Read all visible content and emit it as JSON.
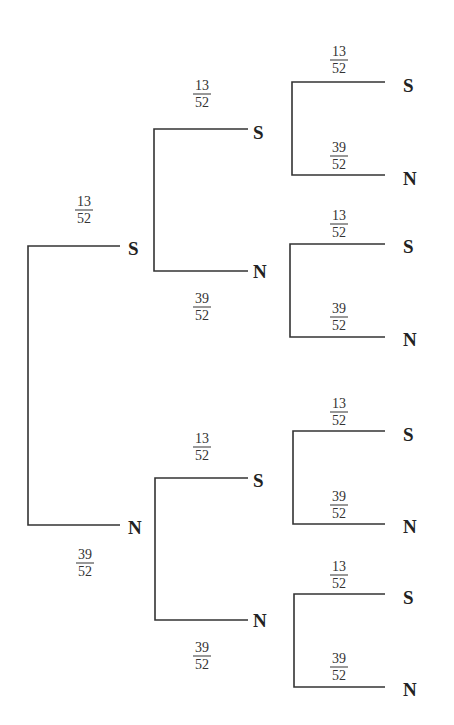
{
  "diagram": {
    "type": "probability-tree",
    "outcomes": {
      "S": "S",
      "N": "N"
    },
    "probabilities": {
      "S": {
        "num": "13",
        "den": "52"
      },
      "N": {
        "num": "39",
        "den": "52"
      }
    },
    "nodes": [
      {
        "id": "l1-S",
        "label": "S",
        "x": 128,
        "y": 248
      },
      {
        "id": "l1-N",
        "label": "N",
        "x": 128,
        "y": 527
      },
      {
        "id": "l2-SS",
        "label": "S",
        "x": 253,
        "y": 132
      },
      {
        "id": "l2-SN",
        "label": "N",
        "x": 253,
        "y": 271
      },
      {
        "id": "l2-NS",
        "label": "S",
        "x": 253,
        "y": 480
      },
      {
        "id": "l2-NN",
        "label": "N",
        "x": 253,
        "y": 620
      },
      {
        "id": "l3-SSS",
        "label": "S",
        "x": 403,
        "y": 85
      },
      {
        "id": "l3-SSN",
        "label": "N",
        "x": 403,
        "y": 178
      },
      {
        "id": "l3-SNS",
        "label": "S",
        "x": 403,
        "y": 246
      },
      {
        "id": "l3-SNN",
        "label": "N",
        "x": 403,
        "y": 339
      },
      {
        "id": "l3-NSS",
        "label": "S",
        "x": 403,
        "y": 434
      },
      {
        "id": "l3-NSN",
        "label": "N",
        "x": 403,
        "y": 526
      },
      {
        "id": "l3-NNS",
        "label": "S",
        "x": 403,
        "y": 597
      },
      {
        "id": "l3-NNN",
        "label": "N",
        "x": 403,
        "y": 689
      }
    ],
    "branch_labels": [
      {
        "num": "13",
        "den": "52",
        "x": 84,
        "y": 210
      },
      {
        "num": "39",
        "den": "52",
        "x": 85,
        "y": 563
      },
      {
        "num": "13",
        "den": "52",
        "x": 202,
        "y": 94
      },
      {
        "num": "39",
        "den": "52",
        "x": 202,
        "y": 307
      },
      {
        "num": "13",
        "den": "52",
        "x": 202,
        "y": 447
      },
      {
        "num": "39",
        "den": "52",
        "x": 202,
        "y": 656
      },
      {
        "num": "13",
        "den": "52",
        "x": 339,
        "y": 60
      },
      {
        "num": "39",
        "den": "52",
        "x": 339,
        "y": 156
      },
      {
        "num": "13",
        "den": "52",
        "x": 339,
        "y": 224
      },
      {
        "num": "39",
        "den": "52",
        "x": 339,
        "y": 317
      },
      {
        "num": "13",
        "den": "52",
        "x": 339,
        "y": 412
      },
      {
        "num": "39",
        "den": "52",
        "x": 339,
        "y": 505
      },
      {
        "num": "13",
        "den": "52",
        "x": 339,
        "y": 575
      },
      {
        "num": "39",
        "den": "52",
        "x": 339,
        "y": 667
      }
    ],
    "line_color": "#333333"
  }
}
